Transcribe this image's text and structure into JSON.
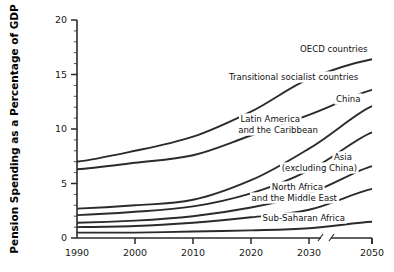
{
  "chart_data": {
    "type": "line",
    "title": "",
    "xlabel": "",
    "ylabel": "Pension Spending as a Percentage of GDP",
    "x": [
      1990,
      2000,
      2010,
      2020,
      2030,
      2050
    ],
    "xlim": [
      1990,
      2050
    ],
    "ylim": [
      0,
      20
    ],
    "ytick_labels": [
      "0",
      "5",
      "10",
      "15",
      "20"
    ],
    "ytick_values": [
      0,
      5,
      10,
      15,
      20
    ],
    "xtick_labels": [
      "1990",
      "2000",
      "2010",
      "2020",
      "2030",
      "2050"
    ],
    "grid": false,
    "legend": "inline-labels-right",
    "axis_break_between": [
      2030,
      2050
    ],
    "series": [
      {
        "name": "OECD countries",
        "label": "OECD countries",
        "label_lines": [
          "OECD countries"
        ],
        "values": [
          7.0,
          8.0,
          9.3,
          11.6,
          14.6,
          16.4
        ]
      },
      {
        "name": "Transitional socialist countries",
        "label": "Transitional socialist countries",
        "label_lines": [
          "Transitional socialist countries"
        ],
        "values": [
          6.3,
          6.9,
          7.6,
          9.4,
          11.3,
          13.6
        ]
      },
      {
        "name": "China",
        "label": "China",
        "label_lines": [
          "China"
        ],
        "values": [
          2.7,
          3.0,
          3.5,
          5.3,
          8.2,
          12.1
        ]
      },
      {
        "name": "Latin America and the Caribbean",
        "label": "Latin America and the Caribbean",
        "label_lines": [
          "Latin America",
          "and the Caribbean"
        ],
        "values": [
          2.1,
          2.4,
          2.9,
          4.1,
          6.2,
          9.7
        ]
      },
      {
        "name": "Asia (excluding China)",
        "label": "Asia (excluding China)",
        "label_lines": [
          "Asia",
          "(excluding China)"
        ],
        "values": [
          1.4,
          1.6,
          2.0,
          2.8,
          4.1,
          6.6
        ]
      },
      {
        "name": "North Africa and the Middle East",
        "label": "North Africa and the Middle East",
        "label_lines": [
          "North Africa",
          "and the Middle East"
        ],
        "values": [
          1.0,
          1.1,
          1.4,
          1.9,
          2.6,
          4.5
        ]
      },
      {
        "name": "Sub-Saharan Africa",
        "label": "Sub-Saharan Africa",
        "label_lines": [
          "Sub-Saharan Africa"
        ],
        "values": [
          0.5,
          0.5,
          0.6,
          0.7,
          0.9,
          1.5
        ]
      }
    ]
  },
  "axis": {
    "y_title": "Pension Spending as a Percentage of GDP",
    "y_ticks": [
      {
        "label": "20",
        "value": 20
      },
      {
        "label": "15",
        "value": 15
      },
      {
        "label": "10",
        "value": 10
      },
      {
        "label": "5",
        "value": 5
      },
      {
        "label": "0",
        "value": 0
      }
    ],
    "x_ticks": [
      {
        "label": "1990",
        "value": 1990
      },
      {
        "label": "2000",
        "value": 2000
      },
      {
        "label": "2010",
        "value": 2010
      },
      {
        "label": "2020",
        "value": 2020
      },
      {
        "label": "2030",
        "value": 2030
      },
      {
        "label": "2050",
        "value": 2050
      }
    ]
  },
  "labels": {
    "oecd": "OECD countries",
    "transitional": "Transitional socialist countries",
    "china": "China",
    "latam_1": "Latin America",
    "latam_2": "and the Caribbean",
    "asia_1": "Asia",
    "asia_2": "(excluding China)",
    "nafrica_1": "North Africa",
    "nafrica_2": "and the Middle East",
    "ssafrica": "Sub-Saharan Africa"
  },
  "colors": {
    "line": "#2b2b2b",
    "axis": "#2a2a2a",
    "text": "#1a1a1a",
    "background": "#ffffff"
  }
}
